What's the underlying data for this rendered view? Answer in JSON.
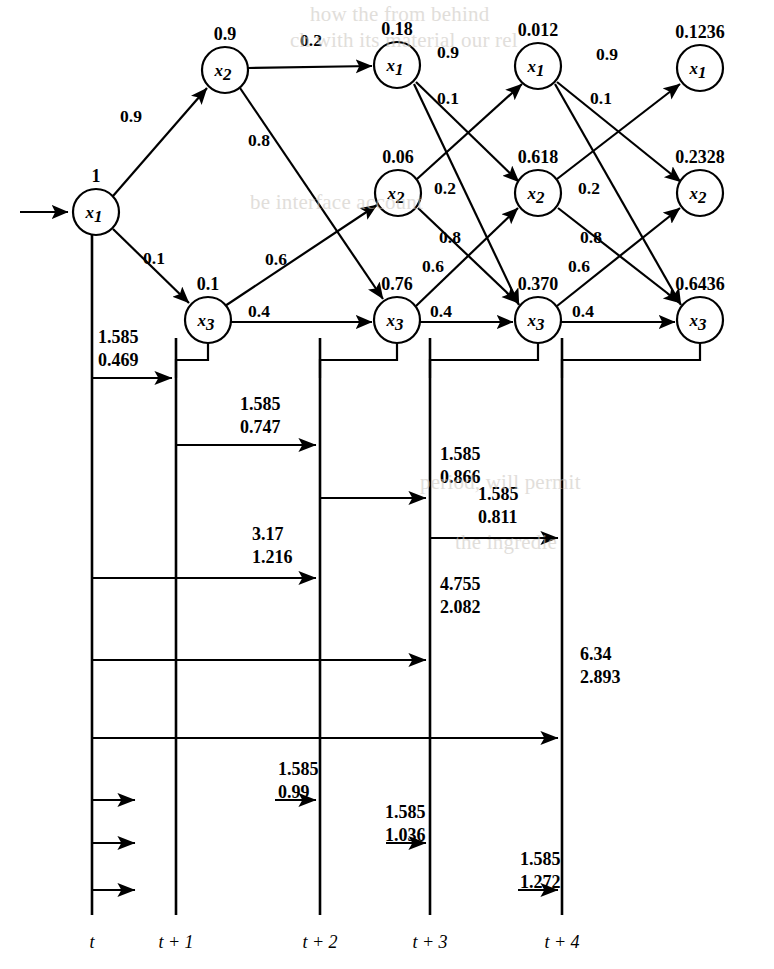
{
  "figure": {
    "type": "time-expanded-network-diagram",
    "node_label_base": "x",
    "columns": [
      {
        "id": "t",
        "axis_label": "t",
        "x": 92
      },
      {
        "id": "t1",
        "axis_label": "t + 1",
        "x": 176
      },
      {
        "id": "t2",
        "axis_label": "t + 2",
        "x": 320
      },
      {
        "id": "t3",
        "axis_label": "t + 3",
        "x": 430
      },
      {
        "id": "t4",
        "axis_label": "t + 4",
        "x": 562
      }
    ],
    "nodes": [
      {
        "name": "node-x1-t",
        "label": "x",
        "sub": "1",
        "cx": 96,
        "cy": 212,
        "value": "1"
      },
      {
        "name": "node-x2-t1",
        "label": "x",
        "sub": "2",
        "cx": 225,
        "cy": 70,
        "value": "0.9"
      },
      {
        "name": "node-x3-t1",
        "label": "x",
        "sub": "3",
        "cx": 208,
        "cy": 320,
        "value": "0.1"
      },
      {
        "name": "node-x1-t2",
        "label": "x",
        "sub": "1",
        "cx": 397,
        "cy": 65,
        "value": "0.18"
      },
      {
        "name": "node-x2-t2",
        "label": "x",
        "sub": "2",
        "cx": 398,
        "cy": 193,
        "value": "0.06"
      },
      {
        "name": "node-x3-t2",
        "label": "x",
        "sub": "3",
        "cx": 397,
        "cy": 320,
        "value": "0.76"
      },
      {
        "name": "node-x1-t3",
        "label": "x",
        "sub": "1",
        "cx": 538,
        "cy": 66,
        "value": "0.012"
      },
      {
        "name": "node-x2-t3",
        "label": "x",
        "sub": "2",
        "cx": 538,
        "cy": 193,
        "value": "0.618"
      },
      {
        "name": "node-x3-t3",
        "label": "x",
        "sub": "3",
        "cx": 538,
        "cy": 320,
        "value": "0.370"
      },
      {
        "name": "node-x1-t4",
        "label": "x",
        "sub": "1",
        "cx": 700,
        "cy": 68,
        "value": "0.1236"
      },
      {
        "name": "node-x2-t4",
        "label": "x",
        "sub": "2",
        "cx": 700,
        "cy": 193,
        "value": "0.2328"
      },
      {
        "name": "node-x3-t4",
        "label": "x",
        "sub": "3",
        "cx": 700,
        "cy": 320,
        "value": "0.6436"
      }
    ],
    "transition_weights": [
      {
        "name": "weight-x1t-x2t1",
        "value": "0.9",
        "x": 120,
        "y": 122
      },
      {
        "name": "weight-x1t-x3t1",
        "value": "0.1",
        "x": 143,
        "y": 264
      },
      {
        "name": "weight-x2t1-x1t2",
        "value": "0.2",
        "x": 300,
        "y": 46
      },
      {
        "name": "weight-x2t1-x3t2",
        "value": "0.8",
        "x": 248,
        "y": 146
      },
      {
        "name": "weight-x3t1-x2t2",
        "value": "0.6",
        "x": 265,
        "y": 265
      },
      {
        "name": "weight-x3t1-x3t2",
        "value": "0.4",
        "x": 248,
        "y": 317
      },
      {
        "name": "weight-x1t2-x1t3",
        "value": "0.9",
        "x": 437,
        "y": 58
      },
      {
        "name": "weight-x1t2-x2t3",
        "value": "0.1",
        "x": 437,
        "y": 104
      },
      {
        "name": "weight-x2t2-x1t3",
        "value": "0.2",
        "x": 434,
        "y": 194
      },
      {
        "name": "weight-x2t2-x3t3",
        "value": "0.8",
        "x": 439,
        "y": 243
      },
      {
        "name": "weight-x3t2-x2t3",
        "value": "0.6",
        "x": 422,
        "y": 272
      },
      {
        "name": "weight-x3t2-x3t3",
        "value": "0.4",
        "x": 430,
        "y": 317
      },
      {
        "name": "weight-x1t3-x1t4",
        "value": "0.9",
        "x": 596,
        "y": 60
      },
      {
        "name": "weight-x1t3-x2t4",
        "value": "0.1",
        "x": 590,
        "y": 104
      },
      {
        "name": "weight-x2t3-x1t4",
        "value": "0.2",
        "x": 578,
        "y": 194
      },
      {
        "name": "weight-x2t3-x3t4",
        "value": "0.8",
        "x": 580,
        "y": 243
      },
      {
        "name": "weight-x3t3-x2t4",
        "value": "0.6",
        "x": 568,
        "y": 272
      },
      {
        "name": "weight-x3t3-x3t4",
        "value": "0.4",
        "x": 572,
        "y": 317
      }
    ],
    "flow_labels": [
      {
        "name": "flow-label-t-t1",
        "top": "1.585",
        "bottom": "0.469",
        "x": 98,
        "y": 343
      },
      {
        "name": "flow-label-t1-t2",
        "top": "1.585",
        "bottom": "0.747",
        "x": 240,
        "y": 410
      },
      {
        "name": "flow-label-t2-t3",
        "top": "1.585",
        "bottom": "0.866",
        "x": 440,
        "y": 460
      },
      {
        "name": "flow-label-t3-t4",
        "top": "1.585",
        "bottom": "0.811",
        "x": 478,
        "y": 500
      },
      {
        "name": "flow-label-t-t2",
        "top": "3.17",
        "bottom": "1.216",
        "x": 252,
        "y": 540
      },
      {
        "name": "flow-label-t-t3",
        "top": "4.755",
        "bottom": "2.082",
        "x": 440,
        "y": 590
      },
      {
        "name": "flow-label-t-t4",
        "top": "6.34",
        "bottom": "2.893",
        "x": 580,
        "y": 660
      },
      {
        "name": "flow-label-short-t2",
        "top": "1.585",
        "bottom": "0.99",
        "x": 278,
        "y": 775
      },
      {
        "name": "flow-label-short-t3",
        "top": "1.585",
        "bottom": "1.036",
        "x": 385,
        "y": 818
      },
      {
        "name": "flow-label-short-t4",
        "top": "1.585",
        "bottom": "1.272",
        "x": 520,
        "y": 865
      }
    ],
    "background_text": [
      {
        "name": "bleed-text-line-1",
        "text": "how the from behind",
        "x": 310,
        "y": 2
      },
      {
        "name": "bleed-text-line-2",
        "text": "ch with its material our rel",
        "x": 290,
        "y": 28
      },
      {
        "name": "bleed-text-line-3",
        "text": "be interface account",
        "x": 250,
        "y": 190
      },
      {
        "name": "bleed-text-line-4",
        "text": "period, will permit",
        "x": 420,
        "y": 470
      },
      {
        "name": "bleed-text-line-5",
        "text": "the ingredie",
        "x": 455,
        "y": 530
      }
    ]
  }
}
